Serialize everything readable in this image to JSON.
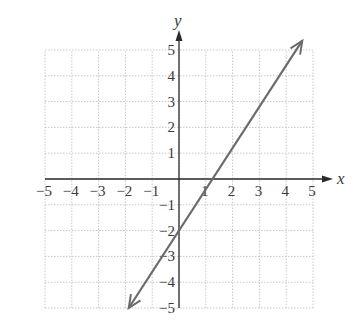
{
  "chart_data": {
    "type": "line",
    "title": "",
    "xlabel": "x",
    "ylabel": "y",
    "xlim": [
      -5,
      5
    ],
    "ylim": [
      -5,
      5
    ],
    "grid": true,
    "x_ticks": [
      -5,
      -4,
      -3,
      -2,
      -1,
      1,
      2,
      3,
      4,
      5
    ],
    "y_ticks": [
      -5,
      -4,
      -3,
      -2,
      -1,
      1,
      2,
      3,
      4,
      5
    ],
    "x_tick_labels": [
      "−5",
      "−4",
      "−3",
      "−2",
      "−1",
      "1",
      "2",
      "3",
      "4",
      "5"
    ],
    "y_tick_labels": [
      "−5",
      "−4",
      "−3",
      "−2",
      "−1",
      "1",
      "2",
      "3",
      "4",
      "5"
    ],
    "series": [
      {
        "name": "line",
        "equation": "y = 1.6x - 2",
        "slope": 1.6,
        "intercept": -2,
        "x": [
          -1.875,
          4.6
        ],
        "y": [
          -5,
          5.36
        ],
        "arrows": "both",
        "color": "#6b6b6b"
      }
    ],
    "points_of_interest": {
      "y_intercept": [
        0,
        -2
      ],
      "x_intercept": [
        1.25,
        0
      ]
    }
  },
  "colors": {
    "axis": "#2a2a2a",
    "grid": "#c8c8c8",
    "line": "#6b6b6b",
    "text": "#3a3a3a"
  },
  "labels": {
    "x_axis": "x",
    "y_axis": "y"
  }
}
